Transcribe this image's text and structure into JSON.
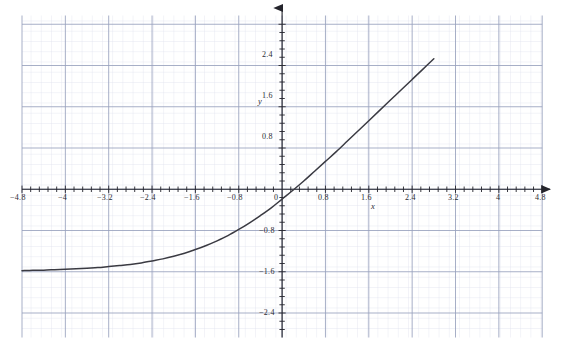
{
  "chart_data": {
    "type": "line",
    "title": "",
    "xlabel": "x",
    "ylabel": "y",
    "xlim": [
      -4.8,
      4.8
    ],
    "ylim": [
      -2.72,
      2.88
    ],
    "grid": true,
    "grid_major_step": 0.8,
    "grid_minor_step": 0.16,
    "legend": "none",
    "xticks": [
      -4.8,
      -4,
      -3.2,
      -2.4,
      -1.6,
      -0.8,
      0,
      0.8,
      1.6,
      2.4,
      3.2,
      4,
      4.8
    ],
    "xtick_labels": [
      "−4.8",
      "−4",
      "−3.2",
      "−2.4",
      "−1.6",
      "−0.8",
      "0",
      "0.8",
      "1.6",
      "2.4",
      "3.2",
      "4",
      "4.8"
    ],
    "yticks": [
      -2.4,
      -1.6,
      -0.8,
      0.8,
      1.6,
      2.4
    ],
    "ytick_labels": [
      "−2.4",
      "−1.6",
      "−0.8",
      "0.8",
      "1.6",
      "2.4"
    ],
    "series": [
      {
        "name": "curve",
        "color": "#3a3a42",
        "x": [
          -4.8,
          -4.6,
          -4.4,
          -4.2,
          -4.0,
          -3.8,
          -3.6,
          -3.4,
          -3.2,
          -3.0,
          -2.8,
          -2.6,
          -2.4,
          -2.2,
          -2.0,
          -1.8,
          -1.6,
          -1.4,
          -1.2,
          -1.0,
          -0.8,
          -0.6,
          -0.4,
          -0.2,
          0.0,
          0.2,
          0.4,
          0.6,
          0.8,
          1.0,
          1.2,
          1.4,
          1.6,
          1.8,
          2.0,
          2.2,
          2.4,
          2.6,
          2.8
        ],
        "y": [
          -1.58,
          -1.57,
          -1.57,
          -1.56,
          -1.55,
          -1.54,
          -1.53,
          -1.52,
          -1.5,
          -1.48,
          -1.46,
          -1.43,
          -1.39,
          -1.35,
          -1.3,
          -1.24,
          -1.17,
          -1.09,
          -1.0,
          -0.9,
          -0.78,
          -0.65,
          -0.51,
          -0.36,
          -0.19,
          -0.02,
          0.16,
          0.35,
          0.54,
          0.73,
          0.93,
          1.13,
          1.33,
          1.53,
          1.73,
          1.93,
          2.13,
          2.33,
          2.53
        ]
      }
    ]
  },
  "axes": {
    "x_axis_label": "x",
    "y_axis_label": "y"
  },
  "colors": {
    "curve": "#3a3a42",
    "axis": "#2b2b33",
    "grid_major": "#9aa4c0",
    "grid_minor": "#d8dded",
    "background": "#ffffff"
  }
}
